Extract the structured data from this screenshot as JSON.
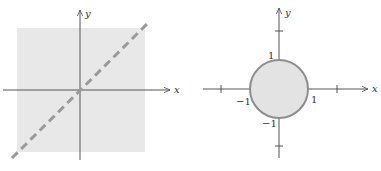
{
  "colors": {
    "axis": "#555555",
    "shade": "#e8e8e8",
    "dash": "#9a9a9a",
    "circle_fill": "#e3e3e3",
    "circle_stroke": "#8e8e8e"
  },
  "left_panel": {
    "description": "Entire plane shaded with the line y = x drawn dashed",
    "x_axis_label": "x",
    "y_axis_label": "y",
    "region": "shaded square covering plane",
    "boundary": "dashed line y = x (excluded)"
  },
  "right_panel": {
    "description": "Closed unit disk shaded with solid boundary circle",
    "x_axis_label": "x",
    "y_axis_label": "y",
    "ticks": {
      "x_pos": "1",
      "x_neg": "−1",
      "y_pos": "1",
      "y_neg": "−1"
    },
    "region": "unit disk",
    "boundary": "solid circle radius 1 (included)"
  }
}
